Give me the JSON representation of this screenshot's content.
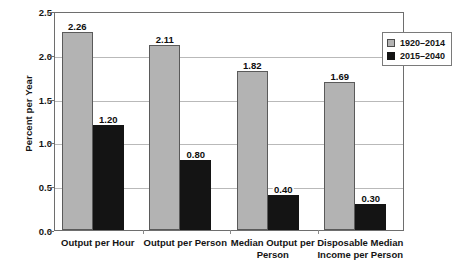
{
  "chart_data": {
    "type": "bar",
    "title": "",
    "xlabel": "",
    "ylabel": "Percent per Year",
    "ylim": [
      0.0,
      2.5
    ],
    "ytick_labels": [
      "0.0",
      "0.5",
      "1.0",
      "1.5",
      "2.0",
      "2.5"
    ],
    "ytick_values": [
      0.0,
      0.5,
      1.0,
      1.5,
      2.0,
      2.5
    ],
    "grid": true,
    "legend_position": "top-right",
    "categories": [
      "Output per Hour",
      "Output per Person",
      "Median Output per Person",
      "Disposable Median Income per Person"
    ],
    "category_lines": [
      [
        "Output per Hour"
      ],
      [
        "Output per Person"
      ],
      [
        "Median Output per",
        "Person"
      ],
      [
        "Disposable Median",
        "Income per Person"
      ]
    ],
    "series": [
      {
        "name": "1920–2014",
        "color": "#b3b3b3",
        "values": [
          2.26,
          2.11,
          1.82,
          1.69
        ],
        "labels": [
          "2.26",
          "2.11",
          "1.82",
          "1.69"
        ]
      },
      {
        "name": "2015–2040",
        "color": "#141414",
        "values": [
          1.2,
          0.8,
          0.4,
          0.3
        ],
        "labels": [
          "1.20",
          "0.80",
          "0.40",
          "0.30"
        ]
      }
    ]
  },
  "legend": {
    "items": [
      {
        "label": "1920–2014"
      },
      {
        "label": "2015–2040"
      }
    ]
  },
  "axes": {
    "y_title": "Percent per Year"
  }
}
